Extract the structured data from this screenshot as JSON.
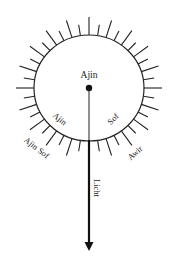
{
  "diagram": {
    "center_label": "Ajin",
    "inner_left_label": "Ajin",
    "inner_right_label": "Sof",
    "outer_left_label": "Ajin Sof",
    "outer_right_label": "Awir",
    "arrow_label": "Licht"
  },
  "colors": {
    "stroke": "#222222",
    "background": "#ffffff"
  }
}
